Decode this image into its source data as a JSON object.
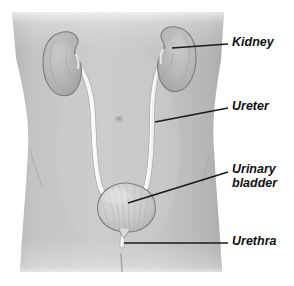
{
  "figure": {
    "view": "anterior view of human torso",
    "background_color": "#ffffff",
    "body_color": "#c3c3c3",
    "organ_color": "#b9b9b9",
    "tube_color": "#f2f2f2",
    "leader_line_color": "#1a1a1a",
    "label_color": "#111111"
  },
  "labels": [
    {
      "id": "kidney",
      "text": "Kidney",
      "lines": [
        "Kidney"
      ],
      "points_to": "right kidney",
      "leader": {
        "x1": 172,
        "y1": 48,
        "x2": 228,
        "y2": 44
      }
    },
    {
      "id": "ureter",
      "text": "Ureter",
      "lines": [
        "Ureter"
      ],
      "points_to": "right ureter",
      "leader": {
        "x1": 155,
        "y1": 122,
        "x2": 228,
        "y2": 108
      }
    },
    {
      "id": "urinary-bladder",
      "text": "Urinary bladder",
      "lines": [
        "Urinary",
        "bladder"
      ],
      "points_to": "urinary bladder",
      "leader": {
        "x1": 128,
        "y1": 203,
        "x2": 228,
        "y2": 172
      }
    },
    {
      "id": "urethra",
      "text": "Urethra",
      "lines": [
        "Urethra"
      ],
      "points_to": "urethra",
      "leader": {
        "x1": 124,
        "y1": 243,
        "x2": 228,
        "y2": 243
      }
    }
  ],
  "structures": [
    {
      "id": "kidney-left",
      "name": "Left kidney (viewer left)"
    },
    {
      "id": "kidney-right",
      "name": "Right kidney (viewer right)"
    },
    {
      "id": "ureter-left",
      "name": "Left ureter"
    },
    {
      "id": "ureter-right",
      "name": "Right ureter"
    },
    {
      "id": "bladder",
      "name": "Urinary bladder"
    },
    {
      "id": "urethra",
      "name": "Urethra"
    },
    {
      "id": "torso",
      "name": "Torso silhouette"
    },
    {
      "id": "navel",
      "name": "Navel"
    }
  ]
}
